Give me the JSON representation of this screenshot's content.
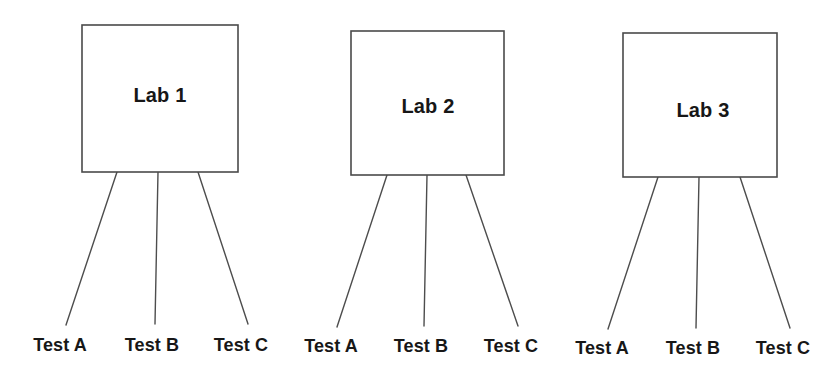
{
  "diagram": {
    "type": "tree",
    "title": "",
    "background_color": "#ffffff",
    "line_color": "#4d4d4d",
    "text_color": "#171717",
    "box_fill_color": "#ffffff",
    "groups": [
      {
        "id": "lab-1",
        "label": "Lab 1",
        "box": {
          "x": 82,
          "y": 25,
          "w": 156,
          "h": 147
        },
        "label_pos": {
          "x": 160,
          "y": 97
        },
        "children": [
          {
            "label": "Test A",
            "from": {
              "x": 117,
              "y": 172
            },
            "to": {
              "x": 66,
              "y": 325
            },
            "label_pos": {
              "x": 60,
              "y": 351
            }
          },
          {
            "label": "Test B",
            "from": {
              "x": 158,
              "y": 172
            },
            "to": {
              "x": 155,
              "y": 324
            },
            "label_pos": {
              "x": 152,
              "y": 351
            }
          },
          {
            "label": "Test C",
            "from": {
              "x": 198,
              "y": 172
            },
            "to": {
              "x": 248,
              "y": 324
            },
            "label_pos": {
              "x": 241,
              "y": 351
            }
          }
        ]
      },
      {
        "id": "lab-2",
        "label": "Lab 2",
        "box": {
          "x": 351,
          "y": 31,
          "w": 153,
          "h": 144
        },
        "label_pos": {
          "x": 428,
          "y": 108
        },
        "children": [
          {
            "label": "Test A",
            "from": {
              "x": 387,
              "y": 175
            },
            "to": {
              "x": 337,
              "y": 327
            },
            "label_pos": {
              "x": 331,
              "y": 352
            }
          },
          {
            "label": "Test B",
            "from": {
              "x": 427,
              "y": 175
            },
            "to": {
              "x": 424,
              "y": 326
            },
            "label_pos": {
              "x": 421,
              "y": 352
            }
          },
          {
            "label": "Test C",
            "from": {
              "x": 466,
              "y": 175
            },
            "to": {
              "x": 518,
              "y": 326
            },
            "label_pos": {
              "x": 511,
              "y": 352
            }
          }
        ]
      },
      {
        "id": "lab-3",
        "label": "Lab 3",
        "box": {
          "x": 623,
          "y": 33,
          "w": 154,
          "h": 144
        },
        "label_pos": {
          "x": 703,
          "y": 112
        },
        "children": [
          {
            "label": "Test A",
            "from": {
              "x": 658,
              "y": 177
            },
            "to": {
              "x": 608,
              "y": 329
            },
            "label_pos": {
              "x": 602,
              "y": 354
            }
          },
          {
            "label": "Test B",
            "from": {
              "x": 699,
              "y": 177
            },
            "to": {
              "x": 696,
              "y": 328
            },
            "label_pos": {
              "x": 693,
              "y": 354
            }
          },
          {
            "label": "Test C",
            "from": {
              "x": 740,
              "y": 177
            },
            "to": {
              "x": 790,
              "y": 328
            },
            "label_pos": {
              "x": 783,
              "y": 354
            }
          }
        ]
      }
    ]
  }
}
